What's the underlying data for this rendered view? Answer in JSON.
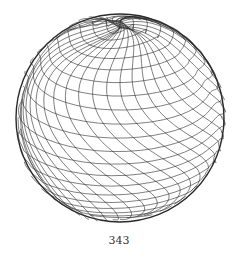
{
  "figure": {
    "line_color": "#2a2a2a",
    "background": "#ffffff",
    "center": [
      120,
      118
    ],
    "radius": 104
  },
  "page": {
    "number": "343"
  }
}
